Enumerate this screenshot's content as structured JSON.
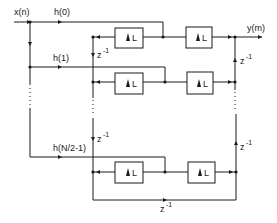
{
  "diagram": {
    "input_label": "x(n)",
    "output_label": "y(m)",
    "coefficients": [
      "h(0)",
      "h(1)",
      "h(N/2-1)"
    ],
    "upsampler_label": "L",
    "delay_label": "z",
    "delay_exp": "-1",
    "rows": [
      {
        "coef": "h(0)",
        "upsampler1": "L",
        "upsampler2": "L"
      },
      {
        "coef": "h(1)",
        "upsampler1": "L",
        "upsampler2": "L"
      },
      {
        "coef": "h(N/2-1)",
        "upsampler1": "L",
        "upsampler2": "L"
      }
    ],
    "colors": {
      "line": "#1a1a1a",
      "background": "#ffffff"
    }
  }
}
